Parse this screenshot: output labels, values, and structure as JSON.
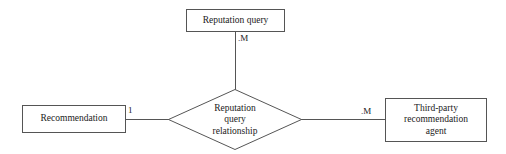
{
  "diagram": {
    "type": "entity-relationship-diagram",
    "width": 506,
    "height": 154,
    "stroke_color": "#555555",
    "text_color": "#1a1a1a",
    "background_color": "#ffffff",
    "entities": {
      "top": {
        "name": "reputation-query",
        "label": "Reputation query"
      },
      "left": {
        "name": "recommendation",
        "label": "Recommendation"
      },
      "right": {
        "name": "third-party-recommendation-agent",
        "line1": "Third-party",
        "line2": "recommendation",
        "line3": "agent"
      }
    },
    "relationship": {
      "name": "reputation-query-relationship",
      "line1": "Reputation",
      "line2": "query",
      "line3": "relationship"
    },
    "cardinalities": {
      "top": ".M",
      "left": "1",
      "right": ".M"
    }
  }
}
